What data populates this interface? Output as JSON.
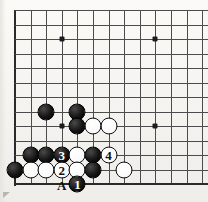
{
  "figure": {
    "kind": "go-board-diagram",
    "board": {
      "width_px": 208,
      "height_px": 202,
      "left_px": 15,
      "top_px": 10,
      "col_spacing_px": 15.6,
      "row_spacing_px": 14.5,
      "cols": 13,
      "rows": 13,
      "edges": {
        "left": true,
        "bottom": true,
        "top": false,
        "right": false
      },
      "line_color": "#4c4c4c",
      "edge_color": "#2a2a2a",
      "background_color": "#f7f6f2"
    },
    "star_points": [
      {
        "col": 3,
        "row": 2
      },
      {
        "col": 9,
        "row": 2
      },
      {
        "col": 9,
        "row": 8
      },
      {
        "col": 3,
        "row": 8
      }
    ],
    "stones": [
      {
        "color": "black",
        "col": 2,
        "row": 7,
        "label": ""
      },
      {
        "color": "black",
        "col": 4,
        "row": 7,
        "label": ""
      },
      {
        "color": "black",
        "col": 4,
        "row": 8,
        "label": ""
      },
      {
        "color": "white",
        "col": 5,
        "row": 8,
        "label": ""
      },
      {
        "color": "white",
        "col": 6,
        "row": 8,
        "label": ""
      },
      {
        "color": "black",
        "col": 1,
        "row": 10,
        "label": ""
      },
      {
        "color": "black",
        "col": 2,
        "row": 10,
        "label": ""
      },
      {
        "color": "black",
        "col": 3,
        "row": 10,
        "label": "3"
      },
      {
        "color": "white",
        "col": 4,
        "row": 10,
        "label": ""
      },
      {
        "color": "black",
        "col": 5,
        "row": 10,
        "label": ""
      },
      {
        "color": "white",
        "col": 6,
        "row": 10,
        "label": "4"
      },
      {
        "color": "black",
        "col": 0,
        "row": 11,
        "label": ""
      },
      {
        "color": "white",
        "col": 1,
        "row": 11,
        "label": ""
      },
      {
        "color": "white",
        "col": 2,
        "row": 11,
        "label": ""
      },
      {
        "color": "white",
        "col": 3,
        "row": 11,
        "label": "2"
      },
      {
        "color": "white",
        "col": 4,
        "row": 11,
        "label": ""
      },
      {
        "color": "black",
        "col": 5,
        "row": 11,
        "label": ""
      },
      {
        "color": "white",
        "col": 7,
        "row": 11,
        "label": ""
      },
      {
        "color": "black",
        "col": 4,
        "row": 12,
        "label": "1"
      }
    ],
    "point_labels": [
      {
        "text": "A",
        "col": 3,
        "row": 12
      }
    ],
    "move_sequence": [
      {
        "number": "1",
        "color": "black"
      },
      {
        "number": "2",
        "color": "white"
      },
      {
        "number": "3",
        "color": "black"
      },
      {
        "number": "4",
        "color": "white"
      }
    ],
    "colors": {
      "black_stone": "#101010",
      "white_stone": "#ffffff",
      "black_label": "#ffffff",
      "white_label": "#111111",
      "grid": "#4c4c4c"
    }
  }
}
